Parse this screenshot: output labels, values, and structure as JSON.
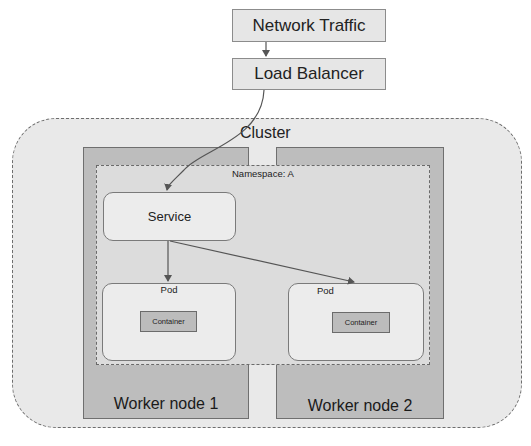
{
  "diagram": {
    "network_traffic": {
      "label": "Network Traffic"
    },
    "load_balancer": {
      "label": "Load Balancer"
    },
    "cluster": {
      "label": "Cluster"
    },
    "namespace": {
      "label": "Namespace: A"
    },
    "service": {
      "label": "Service"
    },
    "worker_nodes": [
      {
        "label": "Worker node 1"
      },
      {
        "label": "Worker node 2"
      }
    ],
    "pods": [
      {
        "label": "Pod",
        "container_label": "Container"
      },
      {
        "label": "Pod",
        "container_label": "Container"
      }
    ],
    "edges": [
      {
        "from": "Network Traffic",
        "to": "Load Balancer"
      },
      {
        "from": "Load Balancer",
        "to": "Service"
      },
      {
        "from": "Service",
        "to": "Pod (Worker node 1)"
      },
      {
        "from": "Service",
        "to": "Pod (Worker node 2)"
      }
    ],
    "colors": {
      "box_fill": "#e6e6e6",
      "cluster_fill": "#e9e9e9",
      "worker_fill": "#bdbdbd",
      "namespace_fill": "#dcdcdc",
      "container_fill": "#bcbcbc",
      "line": "#555555"
    }
  }
}
